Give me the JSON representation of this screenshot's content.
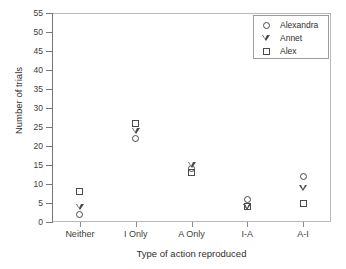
{
  "chart_data": {
    "type": "scatter",
    "title": "",
    "xlabel": "Type of action reproduced",
    "ylabel": "Number of trials",
    "categories": [
      "Neither",
      "I Only",
      "A Only",
      "I-A",
      "A-I"
    ],
    "ylim": [
      0,
      55
    ],
    "yticks": [
      0,
      5,
      10,
      15,
      20,
      25,
      30,
      35,
      40,
      45,
      50,
      55
    ],
    "ytick_labels": [
      "0",
      "5",
      "10",
      "15",
      "20",
      "25",
      "30",
      "35",
      "40",
      "45",
      "50",
      "55"
    ],
    "grid": false,
    "legend_position": "top-right",
    "series": [
      {
        "name": "Alexandra",
        "marker": "circle",
        "values": [
          2,
          22,
          14,
          6,
          12
        ]
      },
      {
        "name": "Annet",
        "marker": "triangle-down",
        "values": [
          4,
          24,
          15,
          4,
          9
        ]
      },
      {
        "name": "Alex",
        "marker": "square",
        "values": [
          8,
          26,
          13,
          4,
          5
        ]
      }
    ]
  },
  "colors": {
    "marker": "#4a4a4a",
    "axis": "#777777",
    "frame": "#b9b9b9",
    "text": "#2e2e2e",
    "background": "#ffffff"
  }
}
